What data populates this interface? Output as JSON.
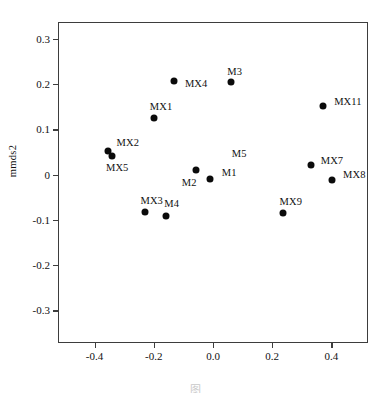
{
  "chart_data": {
    "type": "scatter",
    "title": "",
    "xlabel": "",
    "ylabel": "mmds2",
    "xlim": [
      -0.52,
      0.52
    ],
    "ylim": [
      -0.37,
      0.335
    ],
    "grid": false,
    "legend": null,
    "xticks": [
      "-0.4",
      "-0.2",
      "0.0",
      "0.2",
      "0.4"
    ],
    "xtick_values": [
      -0.4,
      -0.2,
      0.0,
      0.2,
      0.4
    ],
    "yticks": [
      "0.3",
      "0.2",
      "0.1",
      "0",
      "-0.1",
      "-0.2",
      "-0.3"
    ],
    "ytick_values": [
      0.3,
      0.2,
      0.1,
      0.0,
      -0.1,
      -0.2,
      -0.3
    ],
    "marker": "filled-circle",
    "marker_color": "#0b0b0b",
    "points": [
      {
        "label": "MX4",
        "x": -0.132,
        "y": 0.207,
        "label_dx": 11,
        "label_dy": 3
      },
      {
        "label": "M3",
        "x": 0.062,
        "y": 0.204,
        "label_dx": -4,
        "label_dy": -10
      },
      {
        "label": "MX11",
        "x": 0.372,
        "y": 0.152,
        "label_dx": 11,
        "label_dy": -4
      },
      {
        "label": "MX1",
        "x": -0.2,
        "y": 0.126,
        "label_dx": -4,
        "label_dy": -11
      },
      {
        "label": "MX2",
        "x": -0.356,
        "y": 0.053,
        "label_dx": 9,
        "label_dy": -8
      },
      {
        "label": "MX5",
        "x": -0.341,
        "y": 0.042,
        "label_dx": -6,
        "label_dy": 12
      },
      {
        "label": "M5",
        "x": -0.058,
        "y": 0.01,
        "label_dx": 36,
        "label_dy": -16
      },
      {
        "label": "M2",
        "x": -0.058,
        "y": 0.01,
        "label_dx": -14,
        "label_dy": 13
      },
      {
        "label": "MX7",
        "x": 0.33,
        "y": 0.022,
        "label_dx": 10,
        "label_dy": -4
      },
      {
        "label": "M1",
        "x": -0.011,
        "y": -0.01,
        "label_dx": 12,
        "label_dy": -6
      },
      {
        "label": "MX8",
        "x": 0.402,
        "y": -0.012,
        "label_dx": 11,
        "label_dy": -5
      },
      {
        "label": "MX3",
        "x": -0.228,
        "y": -0.083,
        "label_dx": -5,
        "label_dy": -11
      },
      {
        "label": "MX9",
        "x": 0.235,
        "y": -0.086,
        "label_dx": -3,
        "label_dy": -11
      },
      {
        "label": "M4",
        "x": -0.158,
        "y": -0.092,
        "label_dx": -2,
        "label_dy": -12
      }
    ]
  },
  "caption": {
    "text": "图"
  }
}
